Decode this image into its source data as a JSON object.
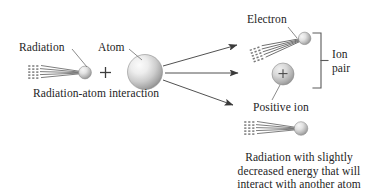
{
  "figure": {
    "type": "diagram",
    "background_color": "#ffffff",
    "ink_color": "#333333",
    "sphere_color_light": "#f2f2f2",
    "sphere_color_mid": "#c9c9c9",
    "sphere_color_dark": "#8a8a8a",
    "labels": {
      "radiation": "Radiation",
      "atom": "Atom",
      "radiation_atom_interaction": "Radiation-atom interaction",
      "electron": "Electron",
      "ion_pair_line1": "Ion",
      "ion_pair_line2": "pair",
      "positive_ion": "Positive ion",
      "outgoing_line1": "Radiation with slightly",
      "outgoing_line2": "decreased energy that will",
      "outgoing_line3": "interact with another atom"
    },
    "symbols": {
      "plus_operator": "+",
      "positive_charge": "+"
    },
    "elements": {
      "incoming_radiation_beam": "horizontal ray bundle with dotted wavefront tail ending in a sphere",
      "atom_sphere": "large shaded sphere",
      "arrow_up": "arrow pointing upper-right toward the electron",
      "arrow_mid": "horizontal arrow pointing right toward the positive ion",
      "arrow_down": "arrow pointing lower-right toward the scattered radiation",
      "electron_symbol": "tilted ray bundle with sphere at upper right",
      "positive_ion_sphere": "sphere marked with a plus sign",
      "ion_pair_bracket": "right-facing square bracket grouping electron and positive ion",
      "scattered_radiation_beam": "horizontal ray bundle with dotted wavefront tail ending in a sphere"
    }
  }
}
